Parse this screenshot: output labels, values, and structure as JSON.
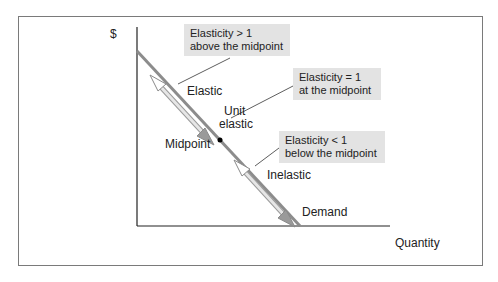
{
  "figure": {
    "y_axis_label": "$",
    "x_axis_label": "Quantity",
    "curve_label": "Demand",
    "region_labels": {
      "elastic": "Elastic",
      "unit_line1": "Unit",
      "unit_line2": "elastic",
      "midpoint": "Midpoint",
      "inelastic": "Inelastic"
    },
    "callouts": [
      {
        "line1": "Elasticity > 1",
        "line2": "above the midpoint"
      },
      {
        "line1": "Elasticity = 1",
        "line2": "at the midpoint"
      },
      {
        "line1": "Elasticity < 1",
        "line2": "below the midpoint"
      }
    ],
    "colors": {
      "demand_line": "#8c8c8c",
      "arrow_fill": "#d4d4d4",
      "callout_bg": "#e3e3e3",
      "axis": "#222222",
      "frame": "#7a7a7a"
    }
  }
}
